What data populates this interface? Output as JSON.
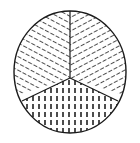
{
  "figure": {
    "type": "geometric-diagram",
    "background_color": "#ffffff",
    "stroke_color": "#1a1a1a",
    "hatch_color": "#111111",
    "canvas": {
      "width": 140,
      "height": 143
    },
    "circle": {
      "center_x": 70,
      "center_y": 72,
      "radius_x": 56,
      "radius_y": 61,
      "outline_width": 1.4,
      "fill": "#ffffff"
    },
    "junction_point": {
      "x": 70,
      "y": 78
    },
    "divider_lines": [
      {
        "name": "divider-up",
        "from_x": 70,
        "from_y": 78,
        "to_x": 70,
        "to_y": 11,
        "angle_deg": 90
      },
      {
        "name": "divider-down-left",
        "from_x": 70,
        "from_y": 78,
        "to_x": 22,
        "to_y": 101,
        "angle_deg": 205
      },
      {
        "name": "divider-down-right",
        "from_x": 70,
        "from_y": 78,
        "to_x": 118,
        "to_y": 101,
        "angle_deg": 335
      }
    ],
    "sectors": [
      {
        "name": "upper-left-sector",
        "label": "Upper left sector",
        "hatch_pattern": "dashed-diagonal-up-right",
        "hatch_angle_deg": 62,
        "hatch_spacing_px": 6,
        "dash_length_px": 4.2,
        "dash_gap_px": 2.6,
        "stroke_width": 1.5,
        "color": "#111111"
      },
      {
        "name": "upper-right-sector",
        "label": "Upper right sector",
        "hatch_pattern": "dashed-diagonal-down-right",
        "hatch_angle_deg": -62,
        "hatch_spacing_px": 6,
        "dash_length_px": 4.2,
        "dash_gap_px": 2.6,
        "stroke_width": 1.5,
        "color": "#111111"
      },
      {
        "name": "bottom-sector",
        "label": "Bottom sector",
        "hatch_pattern": "dashed-vertical",
        "hatch_angle_deg": 90,
        "hatch_spacing_px": 6,
        "dash_length_px": 5.0,
        "dash_gap_px": 3.0,
        "stroke_width": 1.5,
        "color": "#111111"
      }
    ]
  }
}
